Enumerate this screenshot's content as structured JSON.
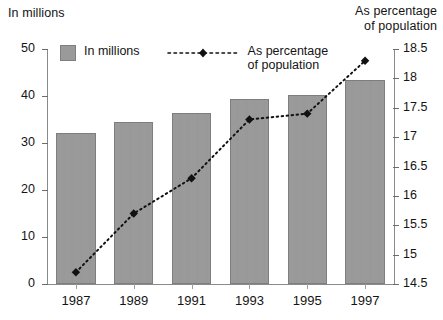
{
  "chart_data": {
    "type": "bar",
    "title": "",
    "categories": [
      "1987",
      "1989",
      "1991",
      "1993",
      "1995",
      "1997"
    ],
    "xlabel": "",
    "grid": false,
    "legend_position": "top",
    "series": [
      {
        "name": "In millions",
        "type": "bar",
        "axis": "left",
        "values": [
          32.1,
          34.5,
          36.4,
          39.4,
          40.2,
          43.3
        ]
      },
      {
        "name": "As percentage of population",
        "type": "line",
        "axis": "right",
        "values": [
          14.7,
          15.7,
          16.3,
          17.3,
          17.4,
          18.3
        ]
      }
    ],
    "left_axis": {
      "label": "In millions",
      "ticks": [
        "0",
        "10",
        "20",
        "30",
        "40",
        "50"
      ],
      "tick_values": [
        0,
        10,
        20,
        30,
        40,
        50
      ],
      "ylim": [
        0,
        50
      ]
    },
    "right_axis": {
      "label": "As percentage\nof population",
      "ticks": [
        "14.5",
        "15",
        "15.5",
        "16",
        "16.5",
        "17",
        "17.5",
        "18",
        "18.5"
      ],
      "tick_values": [
        14.5,
        15,
        15.5,
        16,
        16.5,
        17,
        17.5,
        18,
        18.5
      ],
      "ylim": [
        14.5,
        18.5
      ]
    }
  },
  "legend": {
    "bar_label": "In millions",
    "line_label": "As percentage\nof population"
  },
  "colors": {
    "bar_fill": "#9a9a9a",
    "bar_stroke": "#7e7e7e",
    "line": "#111111",
    "axis": "#8a8a8a",
    "text": "#141414",
    "background": "#ffffff"
  }
}
